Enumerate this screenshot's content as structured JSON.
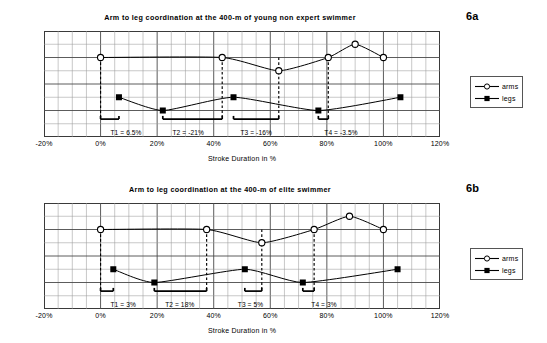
{
  "figure": {
    "axis_label": "Stroke Duration in %",
    "xticks": [
      "-20%",
      "0%",
      "20%",
      "40%",
      "60%",
      "80%",
      "100%",
      "120%"
    ],
    "xtick_values": [
      -20,
      0,
      20,
      40,
      60,
      80,
      100,
      120
    ],
    "legend": {
      "arms": "arms",
      "legs": "legs"
    }
  },
  "panels": [
    {
      "id": "6a",
      "label": "6a",
      "title": "Arm to leg coordination at the 400-m of young non expert swimmer",
      "annotations": [
        {
          "name": "T1",
          "text": "T1 = 6.5%",
          "value": 6.5,
          "x_start": 0.0,
          "x_end": 6.5,
          "label_x": 9.0
        },
        {
          "name": "T2",
          "text": "T2 = -21%",
          "value": -21,
          "x_start": 22.0,
          "x_end": 43.0,
          "label_x": 31.0
        },
        {
          "name": "T3",
          "text": "T3 = -16%",
          "value": -16,
          "x_start": 47.0,
          "x_end": 63.0,
          "label_x": 55.0
        },
        {
          "name": "T4",
          "text": "T4 = -3.5%",
          "value": -3.5,
          "x_start": 77.0,
          "x_end": 80.5,
          "label_x": 85.0
        }
      ],
      "connectors": [
        {
          "x": 0.0
        },
        {
          "x": 43.0
        },
        {
          "x": 63.0
        },
        {
          "x": 80.5
        }
      ],
      "chart_data": {
        "type": "line",
        "title": "Arm to leg coordination at the 400-m of young non expert swimmer",
        "xlabel": "Stroke Duration in %",
        "ylabel": "",
        "xlim": [
          -20,
          120
        ],
        "ylim": [
          0,
          8
        ],
        "grid": true,
        "legend_position": "right",
        "series": [
          {
            "name": "arms",
            "marker": "open-circle",
            "x": [
              0,
              43,
              63,
              80.5,
              90,
              100
            ],
            "y": [
              6.0,
              6.0,
              5.0,
              6.0,
              7.0,
              6.0
            ]
          },
          {
            "name": "legs",
            "marker": "filled-square",
            "x": [
              6.5,
              22,
              47,
              77,
              106
            ],
            "y": [
              3.0,
              2.0,
              3.0,
              2.0,
              3.0
            ]
          }
        ]
      }
    },
    {
      "id": "6b",
      "label": "6b",
      "title": "Arm to leg coordination at the 400-m of elite swimmer",
      "annotations": [
        {
          "name": "T1",
          "text": "T1 = 3%",
          "value": 3,
          "x_start": 0.0,
          "x_end": 4.5,
          "label_x": 8.0
        },
        {
          "name": "T2",
          "text": "T2 = 18%",
          "value": 18,
          "x_start": 19.0,
          "x_end": 37.5,
          "label_x": 28.0
        },
        {
          "name": "T3",
          "text": "T3 = 5%",
          "value": 5,
          "x_start": 51.0,
          "x_end": 57.0,
          "label_x": 53.0
        },
        {
          "name": "T4",
          "text": "T4 = 3%",
          "value": 3,
          "x_start": 71.5,
          "x_end": 75.5,
          "label_x": 79.0
        }
      ],
      "connectors": [
        {
          "x": 0.0
        },
        {
          "x": 37.5
        },
        {
          "x": 57.0
        },
        {
          "x": 75.5
        }
      ],
      "chart_data": {
        "type": "line",
        "title": "Arm to leg coordination at the 400-m of elite swimmer",
        "xlabel": "Stroke Duration in %",
        "ylabel": "",
        "xlim": [
          -20,
          120
        ],
        "ylim": [
          0,
          8
        ],
        "grid": true,
        "legend_position": "right",
        "series": [
          {
            "name": "arms",
            "marker": "open-circle",
            "x": [
              0,
              37.5,
              57,
              75.5,
              88,
              100
            ],
            "y": [
              6.0,
              6.0,
              5.0,
              6.0,
              7.0,
              6.0
            ]
          },
          {
            "name": "legs",
            "marker": "filled-square",
            "x": [
              4.5,
              19,
              51,
              71.5,
              105
            ],
            "y": [
              3.0,
              2.0,
              3.0,
              2.0,
              3.0
            ]
          }
        ]
      }
    }
  ]
}
